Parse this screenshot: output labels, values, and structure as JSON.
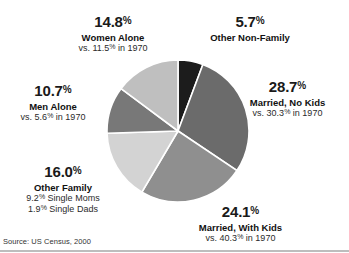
{
  "source_note": "Source: US Census, 2000",
  "chart_data": {
    "type": "pie",
    "title": "",
    "subtitle": "",
    "xlabel": "",
    "ylabel": "",
    "grid": false,
    "legend_position": "callout-labels",
    "start_angle_deg": 0,
    "direction": "clockwise",
    "value_unit": "percent",
    "categories": [
      "Other Non-Family",
      "Married, No Kids",
      "Married, With Kids",
      "Other Family",
      "Men Alone",
      "Women Alone"
    ],
    "values": [
      5.7,
      28.7,
      24.1,
      16.0,
      10.7,
      14.8
    ],
    "comparison_year": 1970,
    "comparison_values": [
      null,
      30.3,
      40.3,
      null,
      5.6,
      11.5
    ],
    "slice_colors": [
      "#1c1c1c",
      "#6b6b6b",
      "#8f8f8f",
      "#d3d3d3",
      "#787878",
      "#bfbfbf"
    ],
    "slices": [
      {
        "label": "Other Non-Family",
        "value": 5.7,
        "value_text": "5.7",
        "percent_symbol": "%",
        "comparison_text": "",
        "color": "#1c1c1c"
      },
      {
        "label": "Married, No Kids",
        "value": 28.7,
        "value_text": "28.7",
        "percent_symbol": "%",
        "comparison_text": "vs. 30.3",
        "comparison_symbol": "%",
        "comparison_tail": " in 1970",
        "color": "#6b6b6b"
      },
      {
        "label": "Married, With Kids",
        "value": 24.1,
        "value_text": "24.1",
        "percent_symbol": "%",
        "comparison_text": "vs. 40.3",
        "comparison_symbol": "%",
        "comparison_tail": " in 1970",
        "color": "#8f8f8f"
      },
      {
        "label": "Other Family",
        "value": 16.0,
        "value_text": "16.0",
        "percent_symbol": "%",
        "breakdown_line_1": "9.2",
        "breakdown_symbol_1": "%",
        "breakdown_tail_1": " Single Moms",
        "breakdown_line_2": "1.9",
        "breakdown_symbol_2": "%",
        "breakdown_tail_2": " Single Dads",
        "color": "#d3d3d3"
      },
      {
        "label": "Men Alone",
        "value": 10.7,
        "value_text": "10.7",
        "percent_symbol": "%",
        "comparison_text": "vs. 5.6",
        "comparison_symbol": "%",
        "comparison_tail": " in 1970",
        "color": "#787878"
      },
      {
        "label": "Women Alone",
        "value": 14.8,
        "value_text": "14.8",
        "percent_symbol": "%",
        "comparison_text": "vs. 11.5",
        "comparison_symbol": "%",
        "comparison_tail": " in 1970",
        "color": "#bfbfbf"
      }
    ]
  }
}
